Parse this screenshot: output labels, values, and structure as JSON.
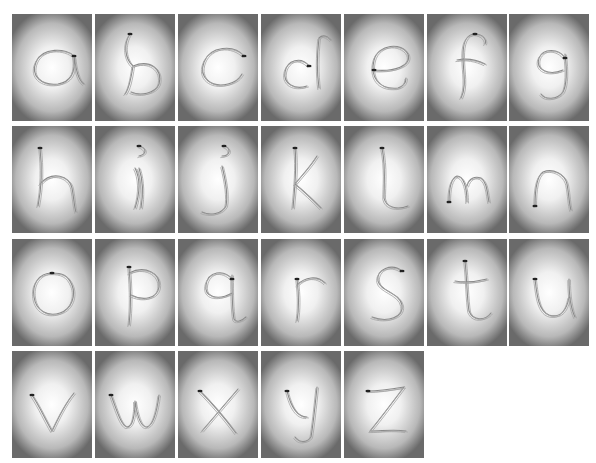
{
  "panels": [
    {
      "letter": "a",
      "row": 0,
      "col": 0
    },
    {
      "letter": "b",
      "row": 0,
      "col": 1
    },
    {
      "letter": "c",
      "row": 0,
      "col": 2
    },
    {
      "letter": "d",
      "row": 0,
      "col": 3
    },
    {
      "letter": "e",
      "row": 0,
      "col": 4
    },
    {
      "letter": "f",
      "row": 0,
      "col": 5
    },
    {
      "letter": "g",
      "row": 0,
      "col": 6
    },
    {
      "letter": "h",
      "row": 1,
      "col": 0
    },
    {
      "letter": "i",
      "row": 1,
      "col": 1
    },
    {
      "letter": "j",
      "row": 1,
      "col": 2
    },
    {
      "letter": "k",
      "row": 1,
      "col": 3
    },
    {
      "letter": "l",
      "row": 1,
      "col": 4
    },
    {
      "letter": "m",
      "row": 1,
      "col": 5
    },
    {
      "letter": "n",
      "row": 1,
      "col": 6
    },
    {
      "letter": "o",
      "row": 2,
      "col": 0
    },
    {
      "letter": "p",
      "row": 2,
      "col": 1
    },
    {
      "letter": "q",
      "row": 2,
      "col": 2
    },
    {
      "letter": "r",
      "row": 2,
      "col": 3
    },
    {
      "letter": "s",
      "row": 2,
      "col": 4
    },
    {
      "letter": "t",
      "row": 2,
      "col": 5
    },
    {
      "letter": "u",
      "row": 2,
      "col": 6
    },
    {
      "letter": "v",
      "row": 3,
      "col": 0
    },
    {
      "letter": "w",
      "row": 3,
      "col": 1
    },
    {
      "letter": "x",
      "row": 3,
      "col": 2
    },
    {
      "letter": "y",
      "row": 3,
      "col": 3
    },
    {
      "letter": "z",
      "row": 3,
      "col": 4
    }
  ]
}
